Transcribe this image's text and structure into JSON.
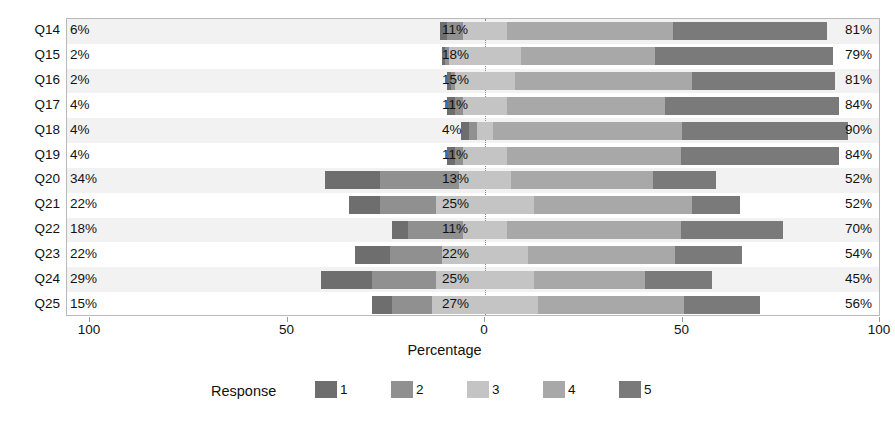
{
  "chart_data": {
    "type": "bar",
    "subtype": "diverging-stacked-likert",
    "title": "",
    "xlabel": "Percentage",
    "ylabel": "",
    "xlim": [
      -100,
      100
    ],
    "xticks": [
      {
        "label": "100",
        "value": -100
      },
      {
        "label": "50",
        "value": -50
      },
      {
        "label": "0",
        "value": 0
      },
      {
        "label": "50",
        "value": 50
      },
      {
        "label": "100",
        "value": 100
      }
    ],
    "grid": false,
    "legend": {
      "title": "Response",
      "position": "bottom",
      "entries": [
        {
          "key": "1",
          "color": "#6e6e6e"
        },
        {
          "key": "2",
          "color": "#909090"
        },
        {
          "key": "3",
          "color": "#c4c4c4"
        },
        {
          "key": "4",
          "color": "#a8a8a8"
        },
        {
          "key": "5",
          "color": "#7a7a7a"
        }
      ]
    },
    "categories": [
      "Q14",
      "Q15",
      "Q16",
      "Q17",
      "Q18",
      "Q19",
      "Q20",
      "Q21",
      "Q22",
      "Q23",
      "Q24",
      "Q25"
    ],
    "series": [
      {
        "name": "1",
        "values": [
          2,
          1,
          1,
          2,
          2,
          2,
          14,
          8,
          4,
          9,
          13,
          5
        ]
      },
      {
        "name": "2",
        "values": [
          4,
          1,
          1,
          2,
          2,
          2,
          20,
          14,
          14,
          13,
          16,
          10
        ]
      },
      {
        "name": "3",
        "values": [
          11,
          18,
          15,
          11,
          4,
          11,
          13,
          25,
          11,
          22,
          25,
          27
        ]
      },
      {
        "name": "4",
        "values": [
          42,
          34,
          45,
          40,
          48,
          44,
          36,
          40,
          44,
          37,
          28,
          37
        ]
      },
      {
        "name": "5",
        "values": [
          39,
          45,
          36,
          44,
          42,
          40,
          16,
          12,
          26,
          17,
          17,
          19
        ]
      }
    ],
    "rows": [
      {
        "label": "Q14",
        "left_pct": "6%",
        "mid_pct": "11%",
        "right_pct": "81%",
        "left": 6,
        "mid": 11,
        "right": 81
      },
      {
        "label": "Q15",
        "left_pct": "2%",
        "mid_pct": "18%",
        "right_pct": "79%",
        "left": 2,
        "mid": 18,
        "right": 79
      },
      {
        "label": "Q16",
        "left_pct": "2%",
        "mid_pct": "15%",
        "right_pct": "81%",
        "left": 2,
        "mid": 15,
        "right": 81
      },
      {
        "label": "Q17",
        "left_pct": "4%",
        "mid_pct": "11%",
        "right_pct": "84%",
        "left": 4,
        "mid": 11,
        "right": 84
      },
      {
        "label": "Q18",
        "left_pct": "4%",
        "mid_pct": "4%",
        "right_pct": "90%",
        "left": 4,
        "mid": 4,
        "right": 90
      },
      {
        "label": "Q19",
        "left_pct": "4%",
        "mid_pct": "11%",
        "right_pct": "84%",
        "left": 4,
        "mid": 11,
        "right": 84
      },
      {
        "label": "Q20",
        "left_pct": "34%",
        "mid_pct": "13%",
        "right_pct": "52%",
        "left": 34,
        "mid": 13,
        "right": 52
      },
      {
        "label": "Q21",
        "left_pct": "22%",
        "mid_pct": "25%",
        "right_pct": "52%",
        "left": 22,
        "mid": 25,
        "right": 52
      },
      {
        "label": "Q22",
        "left_pct": "18%",
        "mid_pct": "11%",
        "right_pct": "70%",
        "left": 18,
        "mid": 11,
        "right": 70
      },
      {
        "label": "Q23",
        "left_pct": "22%",
        "mid_pct": "22%",
        "right_pct": "54%",
        "left": 22,
        "mid": 22,
        "right": 54
      },
      {
        "label": "Q24",
        "left_pct": "29%",
        "mid_pct": "25%",
        "right_pct": "45%",
        "left": 29,
        "mid": 25,
        "right": 45
      },
      {
        "label": "Q25",
        "left_pct": "15%",
        "mid_pct": "27%",
        "right_pct": "56%",
        "left": 15,
        "mid": 27,
        "right": 56
      }
    ]
  },
  "colors": {
    "resp1": "#6e6e6e",
    "resp2": "#909090",
    "resp3": "#c4c4c4",
    "resp4": "#a8a8a8",
    "resp5": "#7a7a7a",
    "panel_border": "#b9b9b9",
    "band": "#f2f2f2",
    "text": "#111111"
  }
}
